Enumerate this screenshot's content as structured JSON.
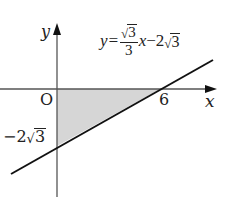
{
  "diagram": {
    "type": "coordinate-graph",
    "axes": {
      "x_label": "x",
      "y_label": "y",
      "origin_label": "O"
    },
    "line": {
      "equation_prefix": "y=",
      "slope_numerator_sqrt": "3",
      "slope_denominator": "3",
      "equation_var": "x",
      "equation_minus": "−2",
      "intercept_sqrt": "3",
      "equation_text": "y = (√3/3)x − 2√3"
    },
    "points": {
      "x_intercept_label": "6",
      "y_intercept_label_prefix": "−2",
      "y_intercept_label_sqrt": "3"
    },
    "shaded_region": {
      "description": "triangle bounded by x-axis, y-axis and line",
      "vertices": [
        "O(0,0)",
        "(6,0)",
        "(0,-2√3)"
      ],
      "fill_color": "#d9d9d9"
    },
    "colors": {
      "axis": "#555555",
      "line": "#111111",
      "text": "#222222"
    }
  }
}
